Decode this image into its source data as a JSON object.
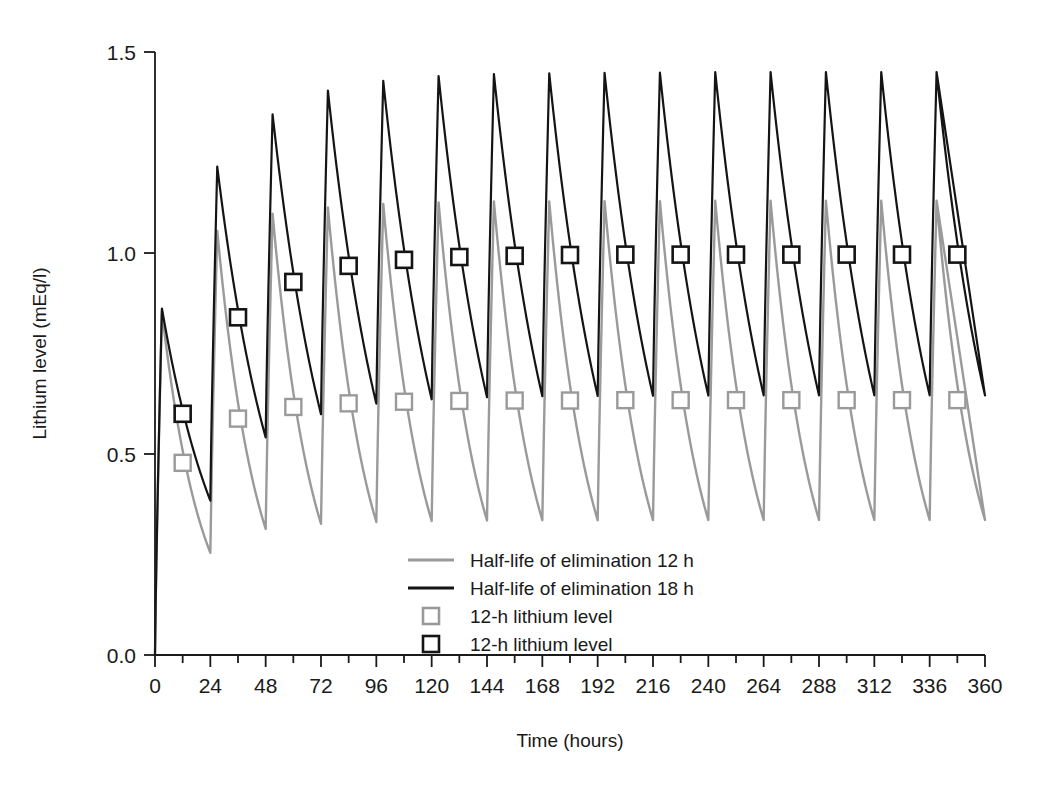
{
  "chart_data": {
    "type": "line",
    "title": "",
    "xlabel": "Time (hours)",
    "ylabel": "Lithium level (mEq/l)",
    "xlim": [
      0,
      360
    ],
    "ylim": [
      0.0,
      1.5
    ],
    "grid": false,
    "legend_position": "inside-bottom-center",
    "x_major_ticks": [
      0,
      24,
      48,
      72,
      96,
      120,
      144,
      168,
      192,
      216,
      240,
      264,
      288,
      312,
      336,
      360
    ],
    "x_minor_tick_interval": 12,
    "x_tick_labels": [
      "0",
      "24",
      "48",
      "72",
      "96",
      "120",
      "144",
      "168",
      "192",
      "216",
      "240",
      "264",
      "288",
      "312",
      "336",
      "360"
    ],
    "y_ticks": [
      0.0,
      0.5,
      1.0,
      1.5
    ],
    "y_tick_labels": [
      "0.0",
      "0.5",
      "1.0",
      "1.5"
    ],
    "dosing_interval_h": 24,
    "n_doses": 15,
    "absorption_time_h": 3,
    "series": [
      {
        "name": "Half-life of elimination 12 h",
        "color": "#9a9a9a",
        "line_width": 2.4,
        "half_life_h": 12,
        "peaks": [
          0.855,
          1.055,
          1.098,
          1.113,
          1.122,
          1.126,
          1.128,
          1.128,
          1.129,
          1.129,
          1.13,
          1.13,
          1.13,
          1.13,
          1.13
        ],
        "troughs": [
          0.232,
          0.29,
          0.304,
          0.308,
          0.31,
          0.311,
          0.312,
          0.312,
          0.312,
          0.312,
          0.313,
          0.313,
          0.313,
          0.313,
          0.313
        ],
        "marker_values_12h": [
          0.478,
          0.588,
          0.617,
          0.626,
          0.63,
          0.632,
          0.633,
          0.633,
          0.634,
          0.634,
          0.634,
          0.634,
          0.634,
          0.634,
          0.634
        ],
        "marker_x_h": [
          12,
          36,
          60,
          84,
          108,
          132,
          156,
          180,
          204,
          228,
          252,
          276,
          300,
          324,
          348
        ]
      },
      {
        "name": "Half-life of elimination 18 h",
        "color": "#141414",
        "line_width": 2.2,
        "half_life_h": 18,
        "peaks": [
          0.862,
          1.215,
          1.345,
          1.404,
          1.428,
          1.44,
          1.445,
          1.447,
          1.448,
          1.449,
          1.45,
          1.45,
          1.45,
          1.45,
          1.45
        ],
        "troughs": [
          0.378,
          0.53,
          0.589,
          0.613,
          0.623,
          0.628,
          0.63,
          0.631,
          0.631,
          0.632,
          0.632,
          0.632,
          0.632,
          0.632,
          0.632
        ],
        "marker_values_12h": [
          0.6,
          0.84,
          0.928,
          0.968,
          0.983,
          0.99,
          0.993,
          0.995,
          0.996,
          0.996,
          0.996,
          0.996,
          0.996,
          0.996,
          0.996
        ],
        "marker_x_h": [
          12,
          36,
          60,
          84,
          108,
          132,
          156,
          180,
          204,
          228,
          252,
          276,
          300,
          324,
          348
        ]
      }
    ],
    "legend_entries": [
      {
        "label": "Half-life of elimination 12 h",
        "type": "line",
        "color": "#9a9a9a"
      },
      {
        "label": "Half-life of elimination 18 h",
        "type": "line",
        "color": "#141414"
      },
      {
        "label": "12-h lithium level",
        "type": "square-marker",
        "color": "#9a9a9a"
      },
      {
        "label": "12-h lithium level",
        "type": "square-marker",
        "color": "#141414"
      }
    ]
  }
}
